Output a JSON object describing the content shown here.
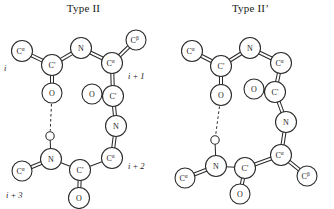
{
  "figure": {
    "background": "#ffffff",
    "stroke_color": "#2b2b2b",
    "text_color": "#1a1a1a"
  },
  "panels": [
    {
      "id": "type-2",
      "title": "Type II",
      "atoms": [
        {
          "id": "L-CA-i",
          "label": "C",
          "sup": "α",
          "x": 22,
          "y": 33,
          "r": 10.5
        },
        {
          "id": "L-C-i",
          "label": "C'",
          "sup": "",
          "x": 52,
          "y": 47,
          "r": 10.5
        },
        {
          "id": "L-O-i",
          "label": "O",
          "sup": "",
          "x": 52,
          "y": 75,
          "r": 10.0
        },
        {
          "id": "L-N-i1",
          "label": "N",
          "sup": "",
          "x": 81,
          "y": 30,
          "r": 10.5
        },
        {
          "id": "L-CA-i1",
          "label": "C",
          "sup": "α",
          "x": 112,
          "y": 45,
          "r": 10.5
        },
        {
          "id": "L-CB-i1",
          "label": "C",
          "sup": "β",
          "x": 136,
          "y": 22,
          "r": 10.0
        },
        {
          "id": "L-C-i1",
          "label": "C'",
          "sup": "",
          "x": 113,
          "y": 78,
          "r": 10.5
        },
        {
          "id": "L-O-i1",
          "label": "O",
          "sup": "",
          "x": 92,
          "y": 76,
          "r": 10.0
        },
        {
          "id": "L-N-i2",
          "label": "N",
          "sup": "",
          "x": 116,
          "y": 108,
          "r": 10.5
        },
        {
          "id": "L-CA-i2",
          "label": "C",
          "sup": "α",
          "x": 112,
          "y": 140,
          "r": 10.5
        },
        {
          "id": "L-C-i2",
          "label": "C'",
          "sup": "",
          "x": 80,
          "y": 152,
          "r": 10.5
        },
        {
          "id": "L-O-i2",
          "label": "O",
          "sup": "",
          "x": 79,
          "y": 180,
          "r": 10.5
        },
        {
          "id": "L-N-i3",
          "label": "N",
          "sup": "",
          "x": 51,
          "y": 141,
          "r": 10.5
        },
        {
          "id": "L-H-i3",
          "label": "",
          "sup": "",
          "x": 50,
          "y": 118,
          "r": 4.2
        },
        {
          "id": "L-CA-i3",
          "label": "C",
          "sup": "α",
          "x": 22,
          "y": 153,
          "r": 10.0
        }
      ],
      "bonds": [
        {
          "from": "L-CA-i",
          "to": "L-C-i",
          "order": 2
        },
        {
          "from": "L-C-i",
          "to": "L-O-i",
          "order": 2
        },
        {
          "from": "L-C-i",
          "to": "L-N-i1",
          "order": 2
        },
        {
          "from": "L-N-i1",
          "to": "L-CA-i1",
          "order": 2
        },
        {
          "from": "L-CA-i1",
          "to": "L-CB-i1",
          "order": 2
        },
        {
          "from": "L-CA-i1",
          "to": "L-C-i1",
          "order": 2
        },
        {
          "from": "L-C-i1",
          "to": "L-O-i1",
          "order": 2
        },
        {
          "from": "L-C-i1",
          "to": "L-N-i2",
          "order": 2
        },
        {
          "from": "L-N-i2",
          "to": "L-CA-i2",
          "order": 2
        },
        {
          "from": "L-CA-i2",
          "to": "L-C-i2",
          "order": 1
        },
        {
          "from": "L-C-i2",
          "to": "L-O-i2",
          "order": 2
        },
        {
          "from": "L-C-i2",
          "to": "L-N-i3",
          "order": 1
        },
        {
          "from": "L-N-i3",
          "to": "L-H-i3",
          "order": 1
        },
        {
          "from": "L-N-i3",
          "to": "L-CA-i3",
          "order": 2
        }
      ],
      "hbonds": [
        {
          "from": "L-O-i",
          "to": "L-H-i3"
        }
      ],
      "residue_labels": [
        {
          "id": "L-idx-i",
          "text": "i",
          "x": 4,
          "y": 50,
          "anchor": "start"
        },
        {
          "id": "L-idx-i1",
          "text": "i + 1",
          "x": 128,
          "y": 58,
          "anchor": "start"
        },
        {
          "id": "L-idx-i2",
          "text": "i + 2",
          "x": 128,
          "y": 148,
          "anchor": "start"
        },
        {
          "id": "L-idx-i3",
          "text": "i + 3",
          "x": 6,
          "y": 177,
          "anchor": "start"
        }
      ]
    },
    {
      "id": "type-2-prime",
      "title": "Type II’",
      "atoms": [
        {
          "id": "R-CA-i",
          "label": "C",
          "sup": "α",
          "x": 25,
          "y": 33,
          "r": 10.5
        },
        {
          "id": "R-C-i",
          "label": "C'",
          "sup": "",
          "x": 54,
          "y": 48,
          "r": 10.5
        },
        {
          "id": "R-O-i",
          "label": "O",
          "sup": "",
          "x": 54,
          "y": 77,
          "r": 10.5
        },
        {
          "id": "R-N-i1",
          "label": "N",
          "sup": "",
          "x": 83,
          "y": 30,
          "r": 10.5
        },
        {
          "id": "R-CA-i1",
          "label": "C",
          "sup": "α",
          "x": 114,
          "y": 45,
          "r": 10.5
        },
        {
          "id": "R-C-i1",
          "label": "C'",
          "sup": "",
          "x": 108,
          "y": 74,
          "r": 10.5
        },
        {
          "id": "R-O-i1",
          "label": "O",
          "sup": "",
          "x": 87,
          "y": 71,
          "r": 10.0
        },
        {
          "id": "R-N-i2",
          "label": "N",
          "sup": "",
          "x": 119,
          "y": 104,
          "ixr": 0,
          "r": 10.5
        },
        {
          "id": "R-CA-i2",
          "label": "C",
          "sup": "α",
          "x": 114,
          "y": 137,
          "r": 10.5
        },
        {
          "id": "R-CB-i2",
          "label": "C",
          "sup": "β",
          "x": 140,
          "y": 158,
          "r": 10.0
        },
        {
          "id": "R-C-i2",
          "label": "C'",
          "sup": "",
          "x": 78,
          "y": 150,
          "r": 10.5
        },
        {
          "id": "R-O-i2",
          "label": "O",
          "sup": "",
          "x": 73,
          "y": 176,
          "r": 10.0
        },
        {
          "id": "R-N-i3",
          "label": "N",
          "sup": "",
          "x": 49,
          "y": 148,
          "r": 10.5
        },
        {
          "id": "R-H-i3",
          "label": "",
          "sup": "",
          "x": 48,
          "y": 122,
          "r": 4.2
        },
        {
          "id": "R-CA-i3",
          "label": "C",
          "sup": "α",
          "x": 18,
          "y": 160,
          "r": 10.0
        }
      ],
      "bonds": [
        {
          "from": "R-CA-i",
          "to": "R-C-i",
          "order": 2
        },
        {
          "from": "R-C-i",
          "to": "R-O-i",
          "order": 2
        },
        {
          "from": "R-C-i",
          "to": "R-N-i1",
          "order": 2
        },
        {
          "from": "R-N-i1",
          "to": "R-CA-i1",
          "order": 2
        },
        {
          "from": "R-CA-i1",
          "to": "R-C-i1",
          "order": 2
        },
        {
          "from": "R-C-i1",
          "to": "R-O-i1",
          "order": 2
        },
        {
          "from": "R-C-i1",
          "to": "R-N-i2",
          "order": 2
        },
        {
          "from": "R-N-i2",
          "to": "R-CA-i2",
          "order": 2
        },
        {
          "from": "R-CA-i2",
          "to": "R-CB-i2",
          "order": 2
        },
        {
          "from": "R-CA-i2",
          "to": "R-C-i2",
          "order": 2
        },
        {
          "from": "R-C-i2",
          "to": "R-O-i2",
          "order": 2
        },
        {
          "from": "R-C-i2",
          "to": "R-N-i3",
          "order": 1
        },
        {
          "from": "R-N-i3",
          "to": "R-H-i3",
          "order": 1
        },
        {
          "from": "R-N-i3",
          "to": "R-CA-i3",
          "order": 2
        }
      ],
      "hbonds": [
        {
          "from": "R-O-i",
          "to": "R-H-i3"
        }
      ],
      "residue_labels": []
    }
  ]
}
